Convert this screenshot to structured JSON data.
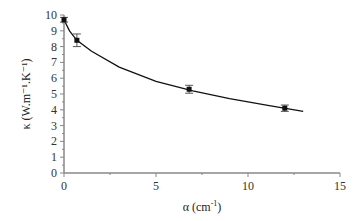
{
  "chart_data": {
    "type": "scatter",
    "title": "",
    "xlabel": "α (cm⁻¹)",
    "ylabel": "κ (W.m⁻¹.K⁻¹)",
    "xlim": [
      0,
      15
    ],
    "ylim": [
      0,
      10
    ],
    "xticks": [
      0,
      5,
      10,
      15
    ],
    "yticks": [
      0,
      1,
      2,
      3,
      4,
      5,
      6,
      7,
      8,
      9,
      10
    ],
    "grid": false,
    "legend": null,
    "series": [
      {
        "name": "measured",
        "marker": "square",
        "x": [
          0,
          0.7,
          6.8,
          12.0
        ],
        "y": [
          9.7,
          8.4,
          5.3,
          4.1
        ],
        "yerr": [
          0.15,
          0.4,
          0.25,
          0.2
        ]
      },
      {
        "name": "fit",
        "style": "line",
        "x": [
          0,
          0.3,
          0.7,
          1.5,
          3,
          5,
          7,
          9,
          11,
          13
        ],
        "y": [
          9.7,
          9.0,
          8.4,
          7.7,
          6.7,
          5.8,
          5.2,
          4.7,
          4.3,
          3.9
        ]
      }
    ]
  },
  "axes": {
    "xlabel_main": "α (cm",
    "xlabel_sup": "-1",
    "xlabel_end": ")",
    "ylabel": "κ (W.m⁻¹.K⁻¹)",
    "xtick_labels": [
      "0",
      "5",
      "10",
      "15"
    ],
    "ytick_labels": [
      "0",
      "1",
      "2",
      "3",
      "4",
      "5",
      "6",
      "7",
      "8",
      "9",
      "10"
    ]
  }
}
